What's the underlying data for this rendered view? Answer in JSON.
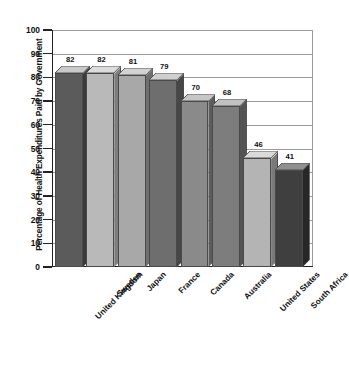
{
  "chart_data": {
    "type": "bar",
    "title": "",
    "subtitle": "",
    "xlabel": "",
    "ylabel": "Percentage of Health Expenditures Paid by Government",
    "ylim": [
      0,
      100
    ],
    "ytick_step": 10,
    "yticks": [
      100,
      90,
      80,
      70,
      60,
      50,
      40,
      30,
      20,
      10,
      0
    ],
    "grid": true,
    "legend": false,
    "legend_position": "none",
    "style": "3d-bar-grayscale",
    "categories": [
      "United Kingdom",
      "Sweden",
      "Japan",
      "France",
      "Canada",
      "Australia",
      "United States",
      "South Africa"
    ],
    "values": [
      82,
      82,
      81,
      79,
      70,
      68,
      46,
      41
    ],
    "value_labels": [
      "82",
      "82",
      "81",
      "79",
      "70",
      "68",
      "46",
      "41"
    ],
    "bar_colors": [
      "#5b5b5b",
      "#b9b9b9",
      "#a8a8a8",
      "#6e6e6e",
      "#8a8a8a",
      "#7d7d7d",
      "#b4b4b4",
      "#3f3f3f"
    ],
    "bar_top_colors": [
      "#c9c9c9",
      "#dcdcdc",
      "#d2d2d2",
      "#cfcfcf",
      "#c6c6c6",
      "#c2c2c2",
      "#dadada",
      "#8f8f8f"
    ],
    "bar_side_colors": [
      "#3a3a3a",
      "#7d7d7d",
      "#6f6f6f",
      "#474747",
      "#5c5c5c",
      "#545454",
      "#7a7a7a",
      "#272727"
    ],
    "axis_color": "#222222",
    "grid_color": "#9a9a9a",
    "background": "#ffffff"
  }
}
